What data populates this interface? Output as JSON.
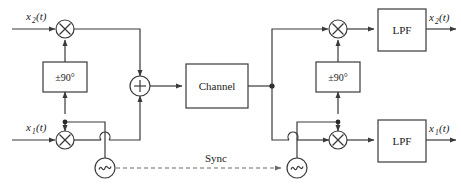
{
  "diagram": {
    "colors": {
      "wire": "#3a3a3a",
      "dashed_wire": "#6b6b6b",
      "text": "#1a1a1a",
      "background": "#ffffff"
    },
    "labels": {
      "input_top": "x",
      "input_top_sub": "2",
      "input_top_arg": "(t)",
      "input_bottom": "x",
      "input_bottom_sub": "1",
      "input_bottom_arg": "(t)",
      "output_top": "x",
      "output_top_sub": "2",
      "output_top_arg": "(t)",
      "output_bottom": "x",
      "output_bottom_sub": "1",
      "output_bottom_arg": "(t)",
      "phase_shift_tx": "±90°",
      "phase_shift_rx": "±90°",
      "channel": "Channel",
      "lpf_top": "LPF",
      "lpf_bottom": "LPF",
      "sync": "Sync",
      "multiplier": "×",
      "summer": "+",
      "oscillator": "∿"
    },
    "blocks": [
      {
        "name": "mixer-tx-top",
        "type": "multiplier",
        "symbol": "×"
      },
      {
        "name": "mixer-tx-bottom",
        "type": "multiplier",
        "symbol": "×"
      },
      {
        "name": "phase-shifter-tx",
        "type": "box",
        "label": "±90°"
      },
      {
        "name": "summer-tx",
        "type": "adder",
        "symbol": "+"
      },
      {
        "name": "channel",
        "type": "box",
        "label": "Channel"
      },
      {
        "name": "mixer-rx-top",
        "type": "multiplier",
        "symbol": "×"
      },
      {
        "name": "mixer-rx-bottom",
        "type": "multiplier",
        "symbol": "×"
      },
      {
        "name": "phase-shifter-rx",
        "type": "box",
        "label": "±90°"
      },
      {
        "name": "lpf-rx-top",
        "type": "box",
        "label": "LPF"
      },
      {
        "name": "lpf-rx-bottom",
        "type": "box",
        "label": "LPF"
      },
      {
        "name": "oscillator-tx",
        "type": "source",
        "symbol": "∿"
      },
      {
        "name": "oscillator-rx",
        "type": "source",
        "symbol": "∿"
      }
    ]
  }
}
